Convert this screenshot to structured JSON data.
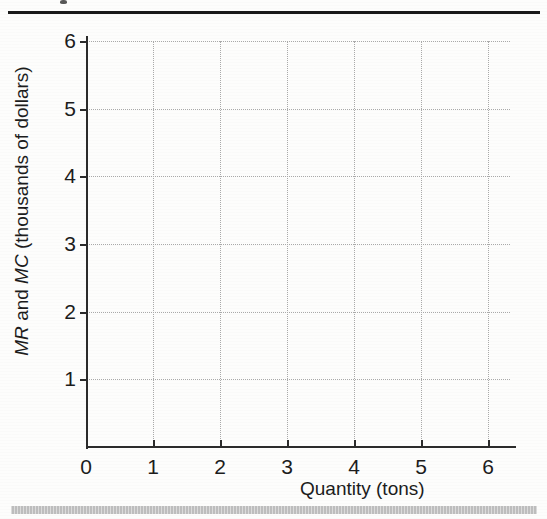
{
  "figure": {
    "top_rule": "horizontal-rule",
    "bottom_bar": "gray-footer-bar"
  },
  "chart_data": {
    "type": "line",
    "title": "",
    "subtitle": "",
    "xlabel": "Quantity (tons)",
    "ylabel": "MR and MC (thousands of dollars)",
    "ylabel_parts": {
      "italic_1": "MR",
      "plain_1": " and ",
      "italic_2": "MC",
      "plain_2": " (thousands of dollars)"
    },
    "xlim": [
      0,
      6.4
    ],
    "ylim": [
      0,
      6.2
    ],
    "x_ticks": [
      0,
      1,
      2,
      3,
      4,
      5,
      6
    ],
    "x_tick_labels": [
      "0",
      "1",
      "2",
      "3",
      "4",
      "5",
      "6"
    ],
    "y_ticks": [
      1,
      2,
      3,
      4,
      5,
      6
    ],
    "y_tick_labels": [
      "1",
      "2",
      "3",
      "4",
      "5",
      "6"
    ],
    "grid": true,
    "grid_style": "dotted",
    "grid_color": "#a9a9a9",
    "legend": null,
    "series": [],
    "annotations": [],
    "note": "Empty plotting grid - no data series drawn"
  },
  "colors": {
    "axis": "#2b2b2b",
    "grid": "#a9a9a9",
    "text": "#1c1c1c",
    "rule": "#1a1a1a",
    "footer_bar": "#bdbdbd",
    "background": "#fdfdfc"
  }
}
